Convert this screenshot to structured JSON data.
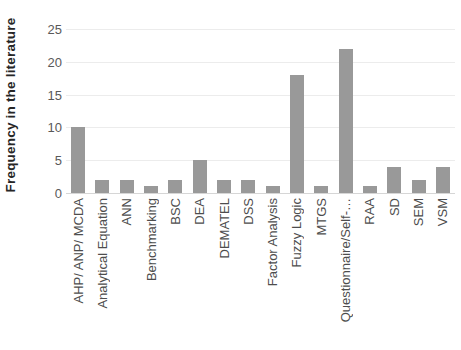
{
  "chart_data": {
    "type": "bar",
    "title": "",
    "xlabel": "",
    "ylabel": "Frequency in the literature",
    "categories": [
      "AHP/ ANP/ MCDA",
      "Analytical Equation",
      "ANN",
      "Benchmarking",
      "BSC",
      "DEA",
      "DEMATEL",
      "DSS",
      "Factor Analysis",
      "Fuzzy Logic",
      "MTGS",
      "Questionnaire/Self-…",
      "RAA",
      "SD",
      "SEM",
      "VSM"
    ],
    "values": [
      10,
      2,
      2,
      1,
      2,
      5,
      2,
      2,
      1,
      18,
      1,
      22,
      1,
      4,
      2,
      4
    ],
    "ylim": [
      0,
      25
    ],
    "yticks": [
      0,
      5,
      10,
      15,
      20,
      25
    ],
    "grid": true,
    "legend": "none",
    "bar_color": "#999999",
    "gridline_color": "#ececec",
    "axis_line_color": "#d6d6d6",
    "tick_label_color": "#595959",
    "category_label_color": "#4d4d4d",
    "ylabel_color": "#262626",
    "background_color": "#ffffff"
  }
}
